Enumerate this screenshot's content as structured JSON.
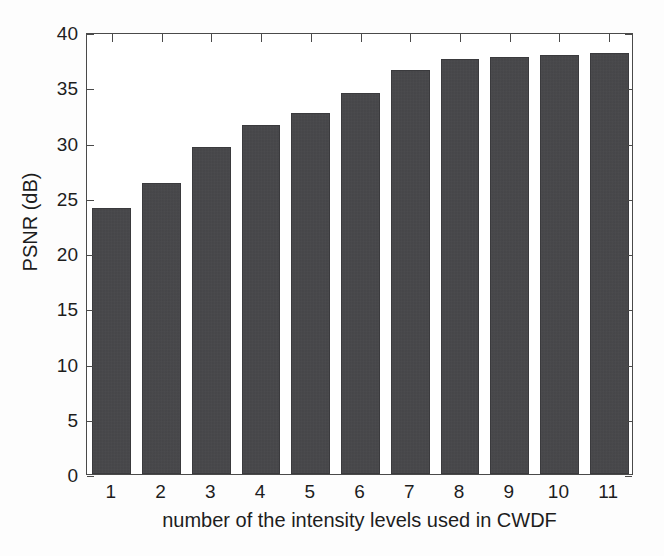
{
  "chart_data": {
    "type": "bar",
    "title": "",
    "xlabel": "number of the intensity levels used in CWDF",
    "ylabel": "PSNR (dB)",
    "categories": [
      "1",
      "2",
      "3",
      "4",
      "5",
      "6",
      "7",
      "8",
      "9",
      "10",
      "11"
    ],
    "values": [
      24.1,
      26.3,
      29.6,
      31.6,
      32.7,
      34.5,
      36.6,
      37.6,
      37.7,
      37.9,
      38.1
    ],
    "ylim": [
      0,
      40
    ],
    "ytick_labels": [
      "0",
      "5",
      "10",
      "15",
      "20",
      "25",
      "30",
      "35",
      "40"
    ],
    "ytick_values": [
      0,
      5,
      10,
      15,
      20,
      25,
      30,
      35,
      40
    ],
    "xtick_labels": [
      "1",
      "2",
      "3",
      "4",
      "5",
      "6",
      "7",
      "8",
      "9",
      "10",
      "11"
    ],
    "grid": false,
    "legend": null,
    "bar_color": "#454548",
    "axis_color": "#4a4a4a",
    "background_color": "#ffffff"
  }
}
